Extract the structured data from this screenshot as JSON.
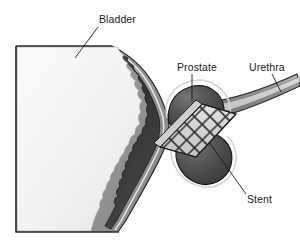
{
  "figure": {
    "type": "anatomical-cross-section",
    "view": "sagittal cross-section",
    "background_color": "#ffffff"
  },
  "labels": {
    "bladder": "Bladder",
    "prostate": "Prostate",
    "urethra": "Urethra",
    "stent": "Stent"
  },
  "structures": {
    "bladder": {
      "name": "bladder",
      "lumen_color": "#f2f2f2",
      "wall_inner_color": "#3d3d3d",
      "wall_outer_color": "#9a9a9a",
      "outline_color": "#2b2b2b",
      "description": "large light-filled cavity at left with scalloped mucosal wall"
    },
    "prostate": {
      "name": "prostate",
      "fill_color": "#4a4a4a",
      "highlight_color": "#6e6e6e",
      "outline_color": "#1f1f1f",
      "lobes": 2,
      "description": "two dark shaded lobes flanking the prostatic urethra"
    },
    "urethra": {
      "name": "urethra",
      "wall_color": "#8c8c8c",
      "lumen_color": "#c8c8c8",
      "outline_color": "#2b2b2b",
      "description": "tubular channel extending to upper right"
    },
    "stent": {
      "name": "stent",
      "mesh_color": "#d8d8d8",
      "strut_color": "#2e2e2e",
      "pattern": "diamond lattice",
      "description": "expandable mesh tube holding the prostatic urethra open"
    }
  },
  "leader_lines": {
    "color": "#1a1a1a",
    "width": 0.9
  }
}
